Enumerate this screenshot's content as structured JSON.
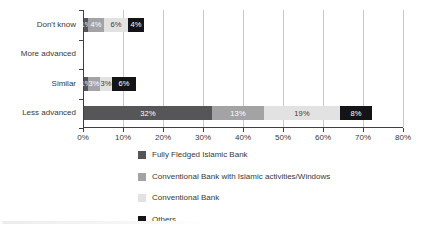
{
  "chart_data": {
    "type": "bar",
    "orientation": "horizontal_stacked",
    "title": "",
    "categories": [
      "Don't know",
      "More advanced",
      "Similar",
      "Less advanced"
    ],
    "series": [
      {
        "name": "Fully Fledged Islamic Bank",
        "color": "#565658",
        "label_text_color": "#ffffff",
        "values": [
          1,
          0,
          1,
          32
        ]
      },
      {
        "name": "Conventional Bank with Islamic activities/Windows",
        "color": "#a3a3a5",
        "label_text_color": "#ffffff",
        "values": [
          4,
          0,
          3,
          13
        ]
      },
      {
        "name": "Conventional Bank",
        "color": "#e2e2e2",
        "label_text_color": "#3a3a3a",
        "values": [
          6,
          0,
          3,
          19
        ]
      },
      {
        "name": "Others",
        "color": "#141416",
        "label_text_color": "#ffffff",
        "values": [
          4,
          0,
          6,
          8
        ]
      }
    ],
    "bar_labels": [
      [
        "1%",
        "4%",
        "6%",
        "4%"
      ],
      [
        "",
        "",
        "",
        ""
      ],
      [
        "1%",
        "3%",
        "3%",
        "6%"
      ],
      [
        "32%",
        "13%",
        "19%",
        "8%"
      ]
    ],
    "x_tick_labels": [
      "0%",
      "10%",
      "20%",
      "30%",
      "40%",
      "50%",
      "60%",
      "70%",
      "80%"
    ],
    "xlim": [
      0,
      80
    ],
    "grid": true,
    "gridline_color": "#c9c9c9",
    "axis_color": "#3f3f3f",
    "text_color": "#383838",
    "legend_position": "bottom"
  }
}
